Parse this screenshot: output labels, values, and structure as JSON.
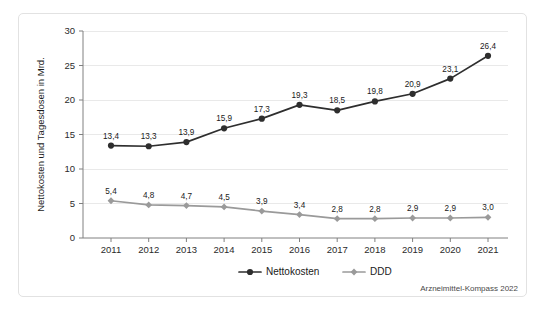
{
  "figure": {
    "source_note": "Arzneimittel-Kompass 2022",
    "background_color": "#ffffff",
    "border_color": "#e2e2e2"
  },
  "chart_data": {
    "type": "line",
    "title": "",
    "xlabel": "",
    "ylabel": "Nettokosten und Tagesdosen in Mrd.",
    "categories": [
      "2011",
      "2012",
      "2013",
      "2014",
      "2015",
      "2016",
      "2017",
      "2018",
      "2019",
      "2020",
      "2021"
    ],
    "x": [
      2011,
      2012,
      2013,
      2014,
      2015,
      2016,
      2017,
      2018,
      2019,
      2020,
      2021
    ],
    "ylim": [
      0,
      30
    ],
    "y_ticks": [
      0,
      5,
      10,
      15,
      20,
      25,
      30
    ],
    "y_tick_labels": [
      "0",
      "5",
      "10",
      "15",
      "20",
      "25",
      "30"
    ],
    "grid": true,
    "grid_axis": "y",
    "legend_position": "bottom-center",
    "series": [
      {
        "name": "Nettokosten",
        "color": "#2e2e2e",
        "marker": "circle",
        "values": [
          13.4,
          13.3,
          13.9,
          15.9,
          17.3,
          19.3,
          18.5,
          19.8,
          20.9,
          23.1,
          26.4
        ],
        "labels": [
          "13,4",
          "13,3",
          "13,9",
          "15,9",
          "17,3",
          "19,3",
          "18,5",
          "19,8",
          "20,9",
          "23,1",
          "26,4"
        ]
      },
      {
        "name": "DDD",
        "color": "#9a9a9a",
        "marker": "diamond",
        "values": [
          5.4,
          4.8,
          4.7,
          4.5,
          3.9,
          3.4,
          2.8,
          2.8,
          2.9,
          2.9,
          3.0
        ],
        "labels": [
          "5,4",
          "4,8",
          "4,7",
          "4,5",
          "3,9",
          "3,4",
          "2,8",
          "2,8",
          "2,9",
          "2,9",
          "3,0"
        ]
      }
    ]
  }
}
